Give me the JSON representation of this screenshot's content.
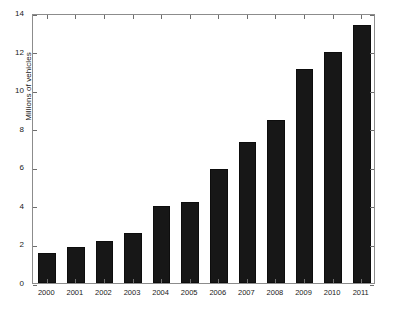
{
  "chart_data": {
    "type": "bar",
    "title": "",
    "xlabel": "",
    "ylabel": "Millions of vehicles",
    "categories": [
      "2000",
      "2001",
      "2002",
      "2003",
      "2004",
      "2005",
      "2006",
      "2007",
      "2008",
      "2009",
      "2010",
      "2011"
    ],
    "values": [
      1.55,
      1.85,
      2.2,
      2.6,
      4.0,
      4.2,
      5.9,
      7.3,
      8.45,
      11.1,
      12.0,
      13.4
    ],
    "ylim": [
      0,
      14
    ],
    "yticks": [
      0,
      2,
      4,
      6,
      8,
      10,
      12,
      14
    ],
    "ytick_labels": [
      "0",
      "2",
      "4",
      "6",
      "8",
      "10",
      "12",
      "14"
    ],
    "grid": false,
    "legend": null,
    "bar_color": "#171717",
    "axis_color": "#8c8c8c",
    "background_color": "#ffffff"
  }
}
